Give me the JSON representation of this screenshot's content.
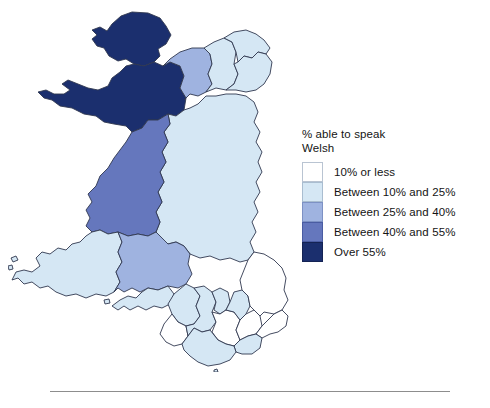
{
  "figure": {
    "kind": "choropleth-map",
    "background_color": "#ffffff"
  },
  "legend": {
    "title": "% able to speak\nWelsh",
    "title_line_1": "% able to speak",
    "title_line_2": "Welsh",
    "items": [
      {
        "label": "10% or less",
        "color": "#ffffff",
        "border": "#b9c4d2"
      },
      {
        "label": "Between 10% and 25%",
        "color": "#d5e7f4",
        "border": "#a9bdd0"
      },
      {
        "label": "Between 25% and 40%",
        "color": "#9fb3e0",
        "border": "#7d91c4"
      },
      {
        "label": "Between 40% and 55%",
        "color": "#6577bd",
        "border": "#4a5ca2"
      },
      {
        "label": "Over 55%",
        "color": "#1b2f6e",
        "border": "#142354"
      }
    ]
  },
  "map_data": {
    "type": "choropleth",
    "value_field": "% able to speak Welsh",
    "classes": [
      "10% or less",
      "Between 10% and 25%",
      "Between 25% and 40%",
      "Between 40% and 55%",
      "Over 55%"
    ],
    "class_colors": [
      "#ffffff",
      "#d5e7f4",
      "#9fb3e0",
      "#6577bd",
      "#1b2f6e"
    ],
    "regions": [
      {
        "name": "Isle of Anglesey",
        "class": "Over 55%",
        "color": "#1b2f6e"
      },
      {
        "name": "Gwynedd",
        "class": "Over 55%",
        "color": "#1b2f6e"
      },
      {
        "name": "Conwy",
        "class": "Between 25% and 40%",
        "color": "#9fb3e0"
      },
      {
        "name": "Denbighshire",
        "class": "Between 10% and 25%",
        "color": "#d5e7f4"
      },
      {
        "name": "Flintshire",
        "class": "Between 10% and 25%",
        "color": "#d5e7f4"
      },
      {
        "name": "Wrexham",
        "class": "Between 10% and 25%",
        "color": "#d5e7f4"
      },
      {
        "name": "Ceredigion",
        "class": "Between 40% and 55%",
        "color": "#6577bd"
      },
      {
        "name": "Powys",
        "class": "Between 10% and 25%",
        "color": "#d5e7f4"
      },
      {
        "name": "Pembrokeshire",
        "class": "Between 10% and 25%",
        "color": "#d5e7f4"
      },
      {
        "name": "Carmarthenshire",
        "class": "Between 25% and 40%",
        "color": "#9fb3e0"
      },
      {
        "name": "Swansea",
        "class": "Between 10% and 25%",
        "color": "#d5e7f4"
      },
      {
        "name": "Neath Port Talbot",
        "class": "Between 10% and 25%",
        "color": "#d5e7f4"
      },
      {
        "name": "Bridgend",
        "class": "10% or less",
        "color": "#ffffff"
      },
      {
        "name": "Rhondda Cynon Taf",
        "class": "Between 10% and 25%",
        "color": "#d5e7f4"
      },
      {
        "name": "Merthyr Tydfil",
        "class": "Between 10% and 25%",
        "color": "#d5e7f4"
      },
      {
        "name": "Caerphilly",
        "class": "10% or less",
        "color": "#ffffff"
      },
      {
        "name": "Blaenau Gwent",
        "class": "Between 10% and 25%",
        "color": "#d5e7f4"
      },
      {
        "name": "Torfaen",
        "class": "10% or less",
        "color": "#ffffff"
      },
      {
        "name": "Monmouthshire",
        "class": "10% or less",
        "color": "#ffffff"
      },
      {
        "name": "Newport",
        "class": "10% or less",
        "color": "#ffffff"
      },
      {
        "name": "Cardiff",
        "class": "Between 10% and 25%",
        "color": "#d5e7f4"
      },
      {
        "name": "Vale of Glamorgan",
        "class": "Between 10% and 25%",
        "color": "#d5e7f4"
      }
    ]
  }
}
